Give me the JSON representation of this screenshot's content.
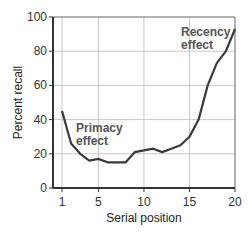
{
  "chart_data": {
    "type": "line",
    "title": "",
    "xlabel": "Serial position",
    "ylabel": "Percent recall",
    "xlim": [
      0.3,
      20
    ],
    "ylim": [
      0,
      100
    ],
    "x_ticks": [
      1,
      5,
      10,
      15,
      20
    ],
    "y_ticks": [
      0,
      20,
      40,
      60,
      80,
      100
    ],
    "grid": true,
    "legend": null,
    "x": [
      1,
      2,
      3,
      4,
      5,
      6,
      7,
      8,
      9,
      10,
      11,
      12,
      13,
      14,
      15,
      16,
      17,
      18,
      19,
      20
    ],
    "series": [
      {
        "name": "Percent recall",
        "values": [
          45,
          26,
          20,
          16,
          17,
          15,
          15,
          15,
          21,
          22,
          23,
          21,
          23,
          25,
          30,
          40,
          60,
          73,
          80,
          93
        ]
      }
    ],
    "annotations": [
      {
        "text_lines": [
          "Primacy",
          "effect"
        ],
        "near_x": 2.5,
        "near_y": 38
      },
      {
        "text_lines": [
          "Recency",
          "effect"
        ],
        "near_x": 17,
        "near_y": 92
      }
    ],
    "line_color": "#3a3a3a",
    "grid_color": "#c8c8c8"
  }
}
